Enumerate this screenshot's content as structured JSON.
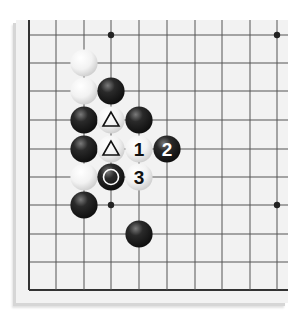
{
  "diagram": {
    "type": "go-board-fragment",
    "grid": {
      "columns": 10,
      "rows": 10,
      "x_lines": [
        29,
        56,
        84,
        111,
        139,
        167,
        195,
        222,
        250,
        277
      ],
      "y_lines": [
        35,
        63,
        91,
        120,
        149,
        177,
        205,
        234,
        262,
        290
      ],
      "left_edge": true,
      "bottom_edge": true
    },
    "star_points": [
      {
        "col": 3,
        "row": 0
      },
      {
        "col": 9,
        "row": 0
      },
      {
        "col": 3,
        "row": 6
      },
      {
        "col": 9,
        "row": 6
      }
    ],
    "stones": [
      {
        "color": "white",
        "col": 2,
        "row": 1,
        "mark": ""
      },
      {
        "color": "white",
        "col": 2,
        "row": 2,
        "mark": ""
      },
      {
        "color": "black",
        "col": 3,
        "row": 2,
        "mark": ""
      },
      {
        "color": "black",
        "col": 2,
        "row": 3,
        "mark": ""
      },
      {
        "color": "white",
        "col": 3,
        "row": 3,
        "mark": "triangle"
      },
      {
        "color": "black",
        "col": 4,
        "row": 3,
        "mark": ""
      },
      {
        "color": "black",
        "col": 2,
        "row": 4,
        "mark": ""
      },
      {
        "color": "white",
        "col": 3,
        "row": 4,
        "mark": "triangle"
      },
      {
        "color": "white",
        "col": 4,
        "row": 4,
        "mark": "",
        "label": "1"
      },
      {
        "color": "black",
        "col": 5,
        "row": 4,
        "mark": "",
        "label": "2"
      },
      {
        "color": "white",
        "col": 2,
        "row": 5,
        "mark": ""
      },
      {
        "color": "black",
        "col": 3,
        "row": 5,
        "mark": "circle"
      },
      {
        "color": "white",
        "col": 4,
        "row": 5,
        "mark": "",
        "label": "3"
      },
      {
        "color": "black",
        "col": 2,
        "row": 6,
        "mark": ""
      },
      {
        "color": "black",
        "col": 4,
        "row": 7,
        "mark": ""
      }
    ],
    "move_labels": [
      "1",
      "2",
      "3"
    ],
    "colors": {
      "board": "#f2f2f2",
      "line": "#555555",
      "black_stone": "#1a1a1a",
      "white_stone": "#f7f7f7"
    }
  }
}
